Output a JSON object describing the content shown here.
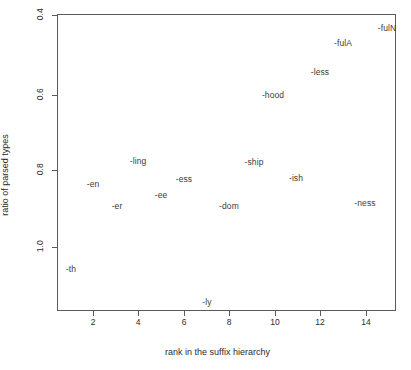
{
  "chart_data": {
    "type": "scatter",
    "title": "",
    "subtitle": "",
    "xlabel": "rank in the suffix hierarchy",
    "ylabel": "ratio of parsed types",
    "xlim": [
      0.25,
      15.7
    ],
    "ylim": [
      0.23,
      1.02
    ],
    "xticks": [
      2,
      4,
      6,
      8,
      10,
      12,
      14
    ],
    "xticklabels": [
      "2",
      "4",
      "6",
      "8",
      "10",
      "12",
      "14"
    ],
    "yticks": [
      0.4,
      0.6,
      0.8,
      1.0
    ],
    "yticklabels": [
      "0.4",
      "0.6",
      "0.8",
      "1.0"
    ],
    "grid": false,
    "legend": "none",
    "marker": "text-label",
    "points": [
      {
        "label": "-th",
        "x": 1,
        "y": 0.344
      },
      {
        "label": "-en",
        "x": 2,
        "y": 0.563
      },
      {
        "label": "-er",
        "x": 3,
        "y": 0.507
      },
      {
        "label": "-ling",
        "x": 4,
        "y": 0.623
      },
      {
        "label": "-ee",
        "x": 5,
        "y": 0.535
      },
      {
        "label": "-ess",
        "x": 6,
        "y": 0.576
      },
      {
        "label": "-ly",
        "x": 7,
        "y": 0.259
      },
      {
        "label": "-dom",
        "x": 8,
        "y": 0.507
      },
      {
        "label": "-ship",
        "x": 9,
        "y": 0.62
      },
      {
        "label": "-hood",
        "x": 10,
        "y": 0.794
      },
      {
        "label": "-ish",
        "x": 11,
        "y": 0.579
      },
      {
        "label": "-less",
        "x": 12,
        "y": 0.853
      },
      {
        "label": "-fulA",
        "x": 13,
        "y": 0.928
      },
      {
        "label": "-ness",
        "x": 14,
        "y": 0.515
      },
      {
        "label": "-fulN",
        "x": 15,
        "y": 0.967
      }
    ],
    "pixel_positions": [
      {
        "label": "-th",
        "left": 14,
        "top": 255
      },
      {
        "label": "-en",
        "left": 36,
        "top": 170
      },
      {
        "label": "-er",
        "left": 60,
        "top": 192
      },
      {
        "label": "-ling",
        "left": 81,
        "top": 147
      },
      {
        "label": "-ee",
        "left": 104,
        "top": 181
      },
      {
        "label": "-ess",
        "left": 127,
        "top": 165
      },
      {
        "label": "-ly",
        "left": 150,
        "top": 288
      },
      {
        "label": "-dom",
        "left": 172,
        "top": 192
      },
      {
        "label": "-ship",
        "left": 197,
        "top": 148
      },
      {
        "label": "-hood",
        "left": 216,
        "top": 81
      },
      {
        "label": "-ish",
        "left": 239,
        "top": 164
      },
      {
        "label": "-less",
        "left": 263,
        "top": 58
      },
      {
        "label": "-fulA",
        "left": 286,
        "top": 29
      },
      {
        "label": "-ness",
        "left": 308,
        "top": 189
      },
      {
        "label": "-fulN",
        "left": 330,
        "top": 14
      }
    ],
    "tick_pixels": {
      "x": [
        93,
        138,
        184,
        229,
        275,
        320,
        366
      ],
      "y": [
        15,
        95,
        170,
        247
      ]
    }
  },
  "colors": {
    "background": "#ffffff",
    "frame": "#5a5a5a",
    "text": "#2b2b2b",
    "label": "#3b3b3b"
  }
}
